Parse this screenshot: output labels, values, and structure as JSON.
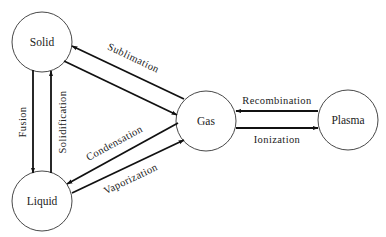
{
  "diagram": {
    "type": "state-transition",
    "nodes": [
      {
        "id": "solid",
        "label": "Solid",
        "cx": 42,
        "cy": 42,
        "r": 30
      },
      {
        "id": "liquid",
        "label": "Liquid",
        "cx": 42,
        "cy": 201,
        "r": 30
      },
      {
        "id": "gas",
        "label": "Gas",
        "cx": 206,
        "cy": 121,
        "r": 30
      },
      {
        "id": "plasma",
        "label": "Plasma",
        "cx": 348,
        "cy": 120,
        "r": 30
      }
    ],
    "edges": [
      {
        "id": "fusion",
        "label": "Fusion",
        "from": "solid",
        "to": "liquid"
      },
      {
        "id": "solidification",
        "label": "Solidification",
        "from": "liquid",
        "to": "solid"
      },
      {
        "id": "sublimation",
        "label": "Sublimation",
        "from": "gas",
        "to": "solid"
      },
      {
        "id": "deposition",
        "label": "",
        "from": "solid",
        "to": "gas"
      },
      {
        "id": "condensation",
        "label": "Condensation",
        "from": "gas",
        "to": "liquid"
      },
      {
        "id": "vaporization",
        "label": "Vaporization",
        "from": "liquid",
        "to": "gas"
      },
      {
        "id": "recombination",
        "label": "Recombination",
        "from": "plasma",
        "to": "gas"
      },
      {
        "id": "ionization",
        "label": "Ionization",
        "from": "gas",
        "to": "plasma"
      }
    ],
    "colors": {
      "stroke": "#111111",
      "background": "#ffffff",
      "text": "#222222"
    }
  }
}
